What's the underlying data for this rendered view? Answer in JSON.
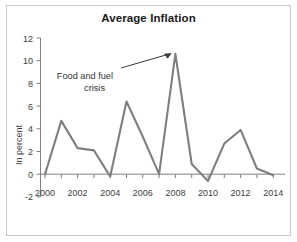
{
  "chart_data": {
    "type": "line",
    "title": "Average Inflation",
    "xlabel": "",
    "ylabel": "In percent",
    "x": [
      2000,
      2001,
      2002,
      2003,
      2004,
      2005,
      2006,
      2007,
      2008,
      2009,
      2010,
      2011,
      2012,
      2013,
      2014
    ],
    "values": [
      0.0,
      4.7,
      2.3,
      2.1,
      -0.2,
      6.4,
      3.3,
      0.0,
      10.6,
      0.9,
      -0.6,
      2.7,
      3.9,
      0.5,
      -0.1
    ],
    "series": [
      {
        "name": "Average Inflation",
        "values": [
          0.0,
          4.7,
          2.3,
          2.1,
          -0.2,
          6.4,
          3.3,
          0.0,
          10.6,
          0.9,
          -0.6,
          2.7,
          3.9,
          0.5,
          -0.1
        ]
      }
    ],
    "xlim": [
      1999.6,
      2014.6
    ],
    "ylim": [
      -2,
      12
    ],
    "ytick_labels": [
      "12",
      "10",
      "8",
      "6",
      "4",
      "2",
      "0",
      "-2"
    ],
    "ytick_values": [
      12,
      10,
      8,
      6,
      4,
      2,
      0,
      -2
    ],
    "xtick_labels": [
      "2000",
      "2002",
      "2004",
      "2006",
      "2008",
      "2010",
      "2012",
      "2014"
    ],
    "xtick_values": [
      2000,
      2002,
      2004,
      2006,
      2008,
      2010,
      2012,
      2014
    ],
    "grid": false,
    "legend": false,
    "line_color": "#7f7f7f",
    "annotations": [
      {
        "text_line1": "Food and fuel",
        "text_line2": "crisis",
        "points_to_x": 2008,
        "points_to_y": 10.6
      }
    ]
  },
  "figure": {
    "border_color": "#c9c9c9",
    "background": "#ffffff"
  }
}
